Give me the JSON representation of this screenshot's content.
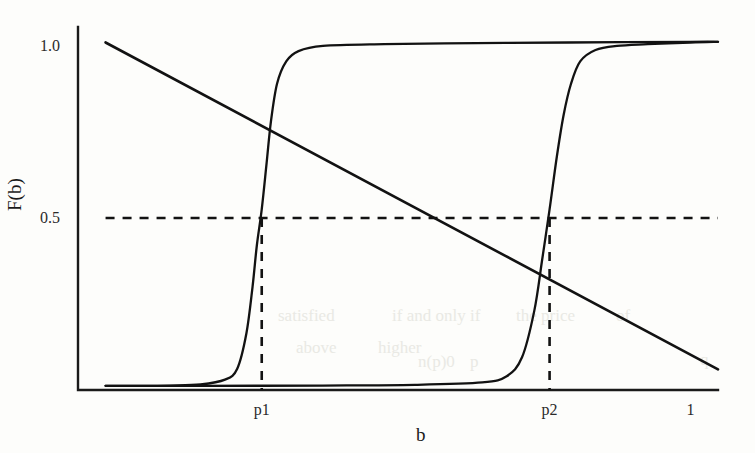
{
  "chart_data": {
    "type": "line",
    "title": "",
    "xlabel": "b",
    "ylabel": "F(b)",
    "xlim": [
      0,
      1.045
    ],
    "ylim": [
      0,
      1.055
    ],
    "grid": false,
    "legend": null,
    "xticks": [
      {
        "label": "p1",
        "value": 0.3
      },
      {
        "label": "p2",
        "value": 0.77
      },
      {
        "label": "1",
        "value": 1.0
      }
    ],
    "yticks": [
      {
        "label": "0.5",
        "value": 0.5
      },
      {
        "label": "1.0",
        "value": 1.0
      }
    ],
    "series": [
      {
        "name": "cdf-low-threshold",
        "style": "solid",
        "description": "Steep logistic CDF centered at p1",
        "center": 0.3,
        "steepness": 70,
        "x": [
          0.045,
          0.1,
          0.15,
          0.2,
          0.24,
          0.26,
          0.275,
          0.285,
          0.292,
          0.3,
          0.308,
          0.315,
          0.325,
          0.34,
          0.36,
          0.4,
          0.5,
          0.65,
          0.8,
          1.0,
          1.045
        ],
        "y": [
          0.012,
          0.012,
          0.013,
          0.016,
          0.03,
          0.062,
          0.165,
          0.3,
          0.42,
          0.525,
          0.66,
          0.78,
          0.89,
          0.955,
          0.985,
          1.0,
          1.005,
          1.008,
          1.01,
          1.012,
          1.012
        ]
      },
      {
        "name": "cdf-high-threshold",
        "style": "solid",
        "description": "Steep logistic CDF centered at p2",
        "center": 0.77,
        "steepness": 70,
        "x": [
          0.045,
          0.2,
          0.4,
          0.55,
          0.66,
          0.7,
          0.725,
          0.745,
          0.758,
          0.77,
          0.782,
          0.793,
          0.805,
          0.82,
          0.845,
          0.88,
          0.93,
          1.0,
          1.045
        ],
        "y": [
          0.012,
          0.012,
          0.013,
          0.015,
          0.022,
          0.04,
          0.095,
          0.23,
          0.38,
          0.525,
          0.68,
          0.8,
          0.89,
          0.955,
          0.988,
          1.0,
          1.005,
          1.01,
          1.012
        ]
      },
      {
        "name": "demand-line",
        "style": "solid",
        "description": "Downward sloping straight line",
        "x": [
          0.045,
          1.045
        ],
        "y": [
          1.01,
          0.06
        ]
      }
    ],
    "annotations": [
      {
        "name": "half-level-guide",
        "style": "dashed",
        "orientation": "horizontal",
        "value": 0.5,
        "x_from": 0.045,
        "x_to": 1.045
      },
      {
        "name": "p1-guide",
        "style": "dashed",
        "orientation": "vertical",
        "value": 0.3,
        "y_from": 0.0,
        "y_to": 0.5
      },
      {
        "name": "p2-guide",
        "style": "dashed",
        "orientation": "vertical",
        "value": 0.77,
        "y_from": 0.0,
        "y_to": 0.5
      }
    ],
    "colors": {
      "background": "#fdfdfb",
      "axis": "#1a1a1a",
      "curve": "#121212",
      "dashed_guide": "#121212",
      "tick_text": "#2a2a2a"
    }
  },
  "bleed_artifacts": [
    {
      "text": "satisfied",
      "x": 278,
      "y": 306
    },
    {
      "text": "if and only if",
      "x": 392,
      "y": 306
    },
    {
      "text": "the price",
      "x": 516,
      "y": 306
    },
    {
      "text": "of",
      "x": 616,
      "y": 306
    },
    {
      "text": "above",
      "x": 296,
      "y": 338
    },
    {
      "text": "higher",
      "x": 378,
      "y": 338
    },
    {
      "text": "n(p)0",
      "x": 418,
      "y": 352
    },
    {
      "text": "p",
      "x": 470,
      "y": 352
    },
    {
      "text": "q",
      "x": 700,
      "y": 350
    }
  ]
}
